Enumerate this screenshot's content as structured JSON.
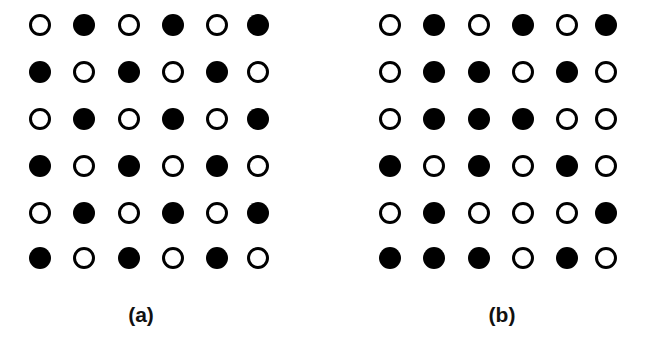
{
  "figure": {
    "legend": {
      "filled": "filled circle",
      "open": "open circle"
    },
    "colors": {
      "dot": "#000000",
      "background": "#ffffff"
    },
    "panels": [
      {
        "id": "a",
        "label": "(a)",
        "label_x": 141,
        "col_x": [
          40,
          84,
          129,
          173,
          217,
          258
        ],
        "row_y": [
          25,
          72,
          119,
          166,
          213,
          258
        ],
        "grid": [
          [
            0,
            1,
            0,
            1,
            0,
            1
          ],
          [
            1,
            0,
            1,
            0,
            1,
            0
          ],
          [
            0,
            1,
            0,
            1,
            0,
            1
          ],
          [
            1,
            0,
            1,
            0,
            1,
            0
          ],
          [
            0,
            1,
            0,
            1,
            0,
            1
          ],
          [
            1,
            0,
            1,
            0,
            1,
            0
          ]
        ]
      },
      {
        "id": "b",
        "label": "(b)",
        "label_x": 502,
        "col_x": [
          390,
          434,
          479,
          523,
          567,
          606
        ],
        "row_y": [
          25,
          72,
          119,
          166,
          213,
          258
        ],
        "grid": [
          [
            0,
            1,
            0,
            1,
            0,
            1
          ],
          [
            0,
            1,
            1,
            0,
            1,
            0
          ],
          [
            0,
            1,
            1,
            1,
            0,
            0
          ],
          [
            1,
            0,
            1,
            0,
            1,
            0
          ],
          [
            0,
            1,
            0,
            0,
            0,
            1
          ],
          [
            1,
            1,
            1,
            0,
            1,
            0
          ]
        ]
      }
    ]
  }
}
